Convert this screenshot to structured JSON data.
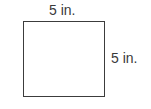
{
  "figure": {
    "shape": "square",
    "top_label": "5 in.",
    "right_label": "5 in.",
    "border_color": "#3c3c3c",
    "label_color": "#3a3a3a",
    "background_color": "#ffffff"
  }
}
